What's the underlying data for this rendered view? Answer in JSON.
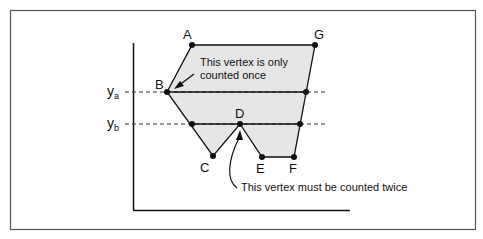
{
  "diagram": {
    "vertex_labels": {
      "A": "A",
      "B": "B",
      "C": "C",
      "D": "D",
      "E": "E",
      "F": "F",
      "G": "G"
    },
    "scanlines": [
      {
        "name": "ya",
        "base": "y",
        "sub": "a"
      },
      {
        "name": "yb",
        "base": "y",
        "sub": "b"
      }
    ],
    "annotations": {
      "once": {
        "line1": "This vertex is only",
        "line2": "counted once"
      },
      "twice": {
        "line1": "This vertex must be counted twice"
      }
    },
    "colors": {
      "fill": "#e6e6e6",
      "stroke": "#111111",
      "frame": "#555555"
    }
  }
}
